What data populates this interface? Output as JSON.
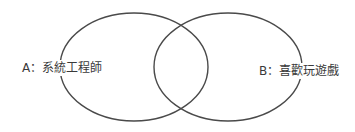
{
  "diagram": {
    "type": "venn",
    "sets": [
      {
        "id": "A",
        "label": "A：系統工程師"
      },
      {
        "id": "B",
        "label": "B：喜歡玩遊戲"
      }
    ],
    "stroke_color": "#4a4a4a"
  }
}
